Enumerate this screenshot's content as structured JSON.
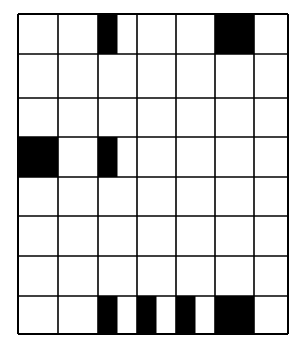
{
  "diagram": {
    "type": "grid",
    "columns": 7,
    "rows": 8,
    "col_edges": [
      18,
      58,
      98,
      137,
      176,
      215,
      254,
      288
    ],
    "row_edges": [
      14,
      54,
      98,
      137,
      177,
      216,
      256,
      296,
      334
    ],
    "line_color": "#000000",
    "fill_color": "#000000",
    "background": "#ffffff",
    "filled_cells": [
      {
        "row": 0,
        "col": 2,
        "fraction": "left-half"
      },
      {
        "row": 0,
        "col": 5,
        "fraction": "full"
      },
      {
        "row": 3,
        "col": 0,
        "fraction": "full"
      },
      {
        "row": 3,
        "col": 2,
        "fraction": "left-half"
      },
      {
        "row": 7,
        "col": 2,
        "fraction": "left-half"
      },
      {
        "row": 7,
        "col": 3,
        "fraction": "left-half"
      },
      {
        "row": 7,
        "col": 4,
        "fraction": "left-half"
      },
      {
        "row": 7,
        "col": 5,
        "fraction": "full"
      }
    ]
  }
}
